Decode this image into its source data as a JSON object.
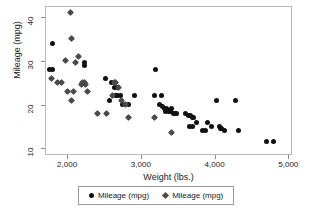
{
  "chart_data": {
    "type": "scatter",
    "title": "",
    "xlabel": "Weight (lbs.)",
    "ylabel": "Mileage (mpg)",
    "xlim": [
      1700,
      5050
    ],
    "ylim": [
      8.5,
      42.5
    ],
    "xticks": [
      2000,
      3000,
      4000,
      5000
    ],
    "xticklabels": [
      "2,000",
      "3,000",
      "4,000",
      "5,000"
    ],
    "yticks": [
      10,
      20,
      30,
      40
    ],
    "yticklabels": [
      "10",
      "20",
      "30",
      "40"
    ],
    "grid": false,
    "legend_position": "below-axes",
    "series": [
      {
        "name": "Mileage (mpg)",
        "marker": "circle",
        "color": "#111111",
        "points": [
          [
            1800,
            34
          ],
          [
            1760,
            28
          ],
          [
            1800,
            28
          ],
          [
            2230,
            29
          ],
          [
            2240,
            29.5
          ],
          [
            2520,
            26
          ],
          [
            2600,
            25
          ],
          [
            2640,
            24
          ],
          [
            2690,
            24
          ],
          [
            2650,
            22
          ],
          [
            2680,
            22
          ],
          [
            2730,
            22
          ],
          [
            2910,
            22
          ],
          [
            2580,
            21
          ],
          [
            2750,
            20
          ],
          [
            2830,
            20
          ],
          [
            3200,
            28
          ],
          [
            3180,
            22
          ],
          [
            3280,
            22
          ],
          [
            3250,
            20
          ],
          [
            3300,
            19.5
          ],
          [
            3320,
            19
          ],
          [
            3350,
            19
          ],
          [
            3330,
            18.5
          ],
          [
            3380,
            18.5
          ],
          [
            3400,
            18.5
          ],
          [
            3420,
            19
          ],
          [
            3440,
            18
          ],
          [
            3470,
            18
          ],
          [
            3490,
            18
          ],
          [
            3600,
            18
          ],
          [
            3640,
            17.5
          ],
          [
            3680,
            17.5
          ],
          [
            3700,
            17
          ],
          [
            3720,
            17
          ],
          [
            3760,
            16
          ],
          [
            3700,
            15
          ],
          [
            3660,
            15
          ],
          [
            3830,
            14
          ],
          [
            3880,
            14
          ],
          [
            3900,
            16
          ],
          [
            3960,
            15
          ],
          [
            4020,
            21
          ],
          [
            4060,
            15
          ],
          [
            4080,
            14.5
          ],
          [
            4100,
            14.5
          ],
          [
            4140,
            14
          ],
          [
            4290,
            21
          ],
          [
            4320,
            14
          ],
          [
            4700,
            11.5
          ],
          [
            4800,
            11.5
          ]
        ]
      },
      {
        "name": "Mileage (mpg)",
        "marker": "diamond",
        "color": "#4a4a4a",
        "points": [
          [
            2050,
            41
          ],
          [
            2060,
            35
          ],
          [
            1790,
            26
          ],
          [
            1870,
            25
          ],
          [
            1930,
            25
          ],
          [
            1980,
            30
          ],
          [
            2150,
            31
          ],
          [
            2120,
            29.5
          ],
          [
            2000,
            23
          ],
          [
            2080,
            23
          ],
          [
            2060,
            21
          ],
          [
            2190,
            24.5
          ],
          [
            2210,
            25
          ],
          [
            2230,
            25
          ],
          [
            2250,
            24.5
          ],
          [
            2280,
            23
          ],
          [
            2410,
            18
          ],
          [
            2540,
            18
          ],
          [
            2640,
            25
          ],
          [
            2660,
            25
          ],
          [
            2700,
            24
          ],
          [
            2620,
            22
          ],
          [
            2740,
            21
          ],
          [
            2790,
            20
          ],
          [
            2830,
            17
          ],
          [
            3180,
            17
          ],
          [
            3420,
            13.7
          ]
        ]
      }
    ]
  },
  "legend": {
    "entries": [
      {
        "label": "Mileage (mpg)",
        "marker": "circle"
      },
      {
        "label": "Mileage (mpg)",
        "marker": "diamond"
      }
    ]
  }
}
